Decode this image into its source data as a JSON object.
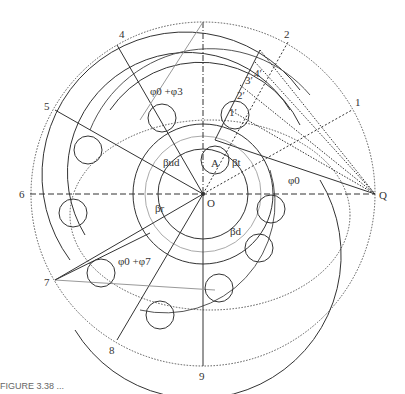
{
  "figure": {
    "center_label": "O",
    "pole_label": "Q",
    "point_label": "A",
    "ray_labels": [
      "1",
      "2",
      "3",
      "4",
      "5",
      "6",
      "7",
      "8",
      "9"
    ],
    "prime_labels": [
      "1′",
      "2′",
      "3′",
      "4′"
    ],
    "angles": {
      "phi0": "φ0",
      "phi0_phi3": "φ0 +φ3",
      "phi0_phi7": "φ0 +φ7",
      "beta_ud": "βud",
      "beta_t": "βt",
      "beta_r": "βr",
      "beta_d": "βd"
    },
    "colors": {
      "line": "#333333",
      "light": "#999999",
      "dotted": "#555555"
    }
  },
  "caption": "FIGURE 3.38 ..."
}
